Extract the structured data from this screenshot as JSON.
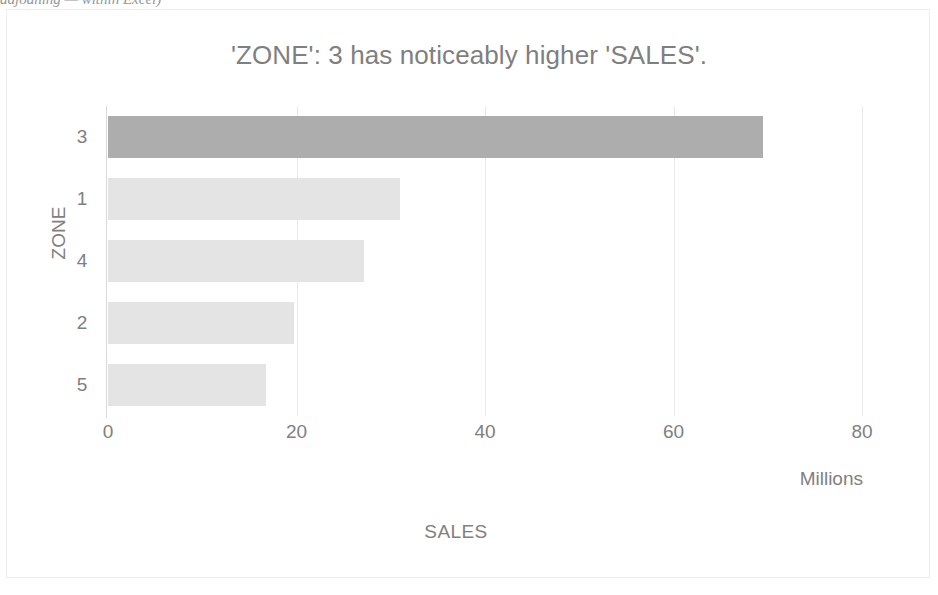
{
  "cropped_header_text": "adjoaning — within Excel)",
  "chart_data": {
    "type": "bar",
    "orientation": "horizontal",
    "title": "'ZONE': 3 has noticeably higher 'SALES'.",
    "xlabel": "SALES",
    "ylabel": "ZONE",
    "units_label": "Millions",
    "categories": [
      "3",
      "1",
      "4",
      "2",
      "5"
    ],
    "values": [
      69.5,
      31.0,
      27.2,
      19.7,
      16.8
    ],
    "xlim": [
      0,
      80
    ],
    "xticks": [
      "0",
      "20",
      "40",
      "60",
      "80"
    ],
    "xtick_values": [
      0,
      20,
      40,
      60,
      80
    ],
    "grid": true,
    "grid_axis": "x",
    "legend": false,
    "highlight_category": "3",
    "colors": {
      "bar_default": "#e4e4e4",
      "bar_highlight": "#adadad",
      "text": "#7f7f7f",
      "gridline": "#e9e9ed",
      "frame_border": "#ededf0",
      "background": "#ffffff"
    }
  }
}
